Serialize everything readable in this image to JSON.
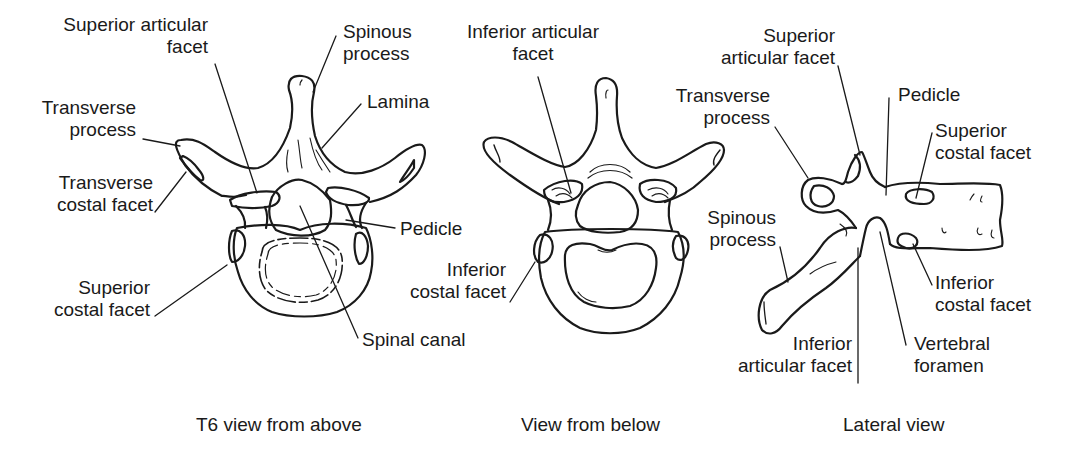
{
  "figure": {
    "stroke_color": "#1a1a1a",
    "background": "#ffffff",
    "panels": [
      {
        "id": "above",
        "caption": "T6 view from above",
        "labels": {
          "superior_articular_facet": [
            "Superior articular",
            "facet"
          ],
          "spinous_process": [
            "Spinous",
            "process"
          ],
          "lamina": [
            "Lamina"
          ],
          "transverse_process": [
            "Transverse",
            "process"
          ],
          "transverse_costal_facet": [
            "Transverse",
            "costal facet"
          ],
          "pedicle": [
            "Pedicle"
          ],
          "superior_costal_facet": [
            "Superior",
            "costal facet"
          ],
          "spinal_canal": [
            "Spinal canal"
          ]
        }
      },
      {
        "id": "below",
        "caption": "View from below",
        "labels": {
          "inferior_articular_facet": [
            "Inferior articular",
            "facet"
          ],
          "inferior_costal_facet": [
            "Inferior",
            "costal facet"
          ]
        }
      },
      {
        "id": "lateral",
        "caption": "Lateral view",
        "labels": {
          "superior_articular_facet": [
            "Superior",
            "articular facet"
          ],
          "transverse_process": [
            "Transverse",
            "process"
          ],
          "pedicle": [
            "Pedicle"
          ],
          "superior_costal_facet": [
            "Superior",
            "costal facet"
          ],
          "spinous_process": [
            "Spinous",
            "process"
          ],
          "inferior_costal_facet": [
            "Inferior",
            "costal facet"
          ],
          "inferior_articular_facet": [
            "Inferior",
            "articular facet"
          ],
          "vertebral_foramen": [
            "Vertebral",
            "foramen"
          ]
        }
      }
    ]
  }
}
